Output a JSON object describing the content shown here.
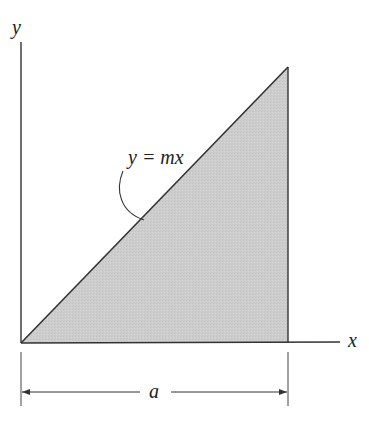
{
  "diagram": {
    "type": "area-under-line",
    "labels": {
      "y_axis": "y",
      "x_axis": "x",
      "curve": "y = mx",
      "dimension": "a"
    },
    "colors": {
      "fill": "#cfcfcf",
      "stroke": "#333333",
      "background": "#ffffff"
    }
  }
}
